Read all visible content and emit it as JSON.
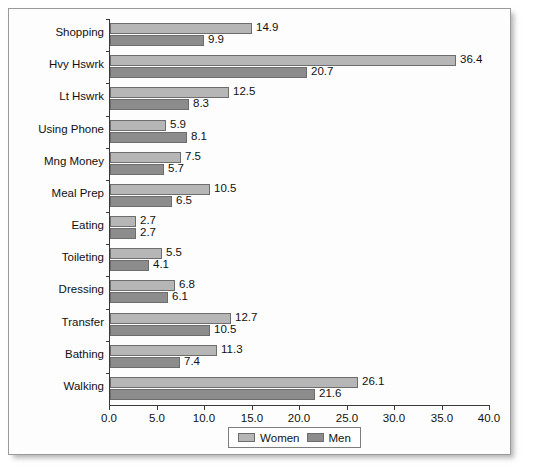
{
  "chart_data": {
    "type": "bar",
    "orientation": "horizontal",
    "title": "",
    "xlabel": "",
    "ylabel": "",
    "xlim": [
      0.0,
      40.0
    ],
    "xticks": [
      "0.0",
      "5.0",
      "10.0",
      "15.0",
      "20.0",
      "25.0",
      "30.0",
      "35.0",
      "40.0"
    ],
    "xtick_values": [
      0,
      5,
      10,
      15,
      20,
      25,
      30,
      35,
      40
    ],
    "grid": false,
    "legend_position": "bottom-center",
    "categories": [
      "Shopping",
      "Hvy Hswrk",
      "Lt Hswrk",
      "Using Phone",
      "Mng Money",
      "Meal Prep",
      "Eating",
      "Toileting",
      "Dressing",
      "Transfer",
      "Bathing",
      "Walking"
    ],
    "series": [
      {
        "name": "Women",
        "color": "#b6b6b6",
        "values": [
          14.9,
          36.4,
          12.5,
          5.9,
          7.5,
          10.5,
          2.7,
          5.5,
          6.8,
          12.7,
          11.3,
          26.1
        ],
        "labels": [
          "14.9",
          "36.4",
          "12.5",
          "5.9",
          "7.5",
          "10.5",
          "2.7",
          "5.5",
          "6.8",
          "12.7",
          "11.3",
          "26.1"
        ]
      },
      {
        "name": "Men",
        "color": "#8c8c8c",
        "values": [
          9.9,
          20.7,
          8.3,
          8.1,
          5.7,
          6.5,
          2.7,
          4.1,
          6.1,
          10.5,
          7.4,
          21.6
        ],
        "labels": [
          "9.9",
          "20.7",
          "8.3",
          "8.1",
          "5.7",
          "6.5",
          "2.7",
          "4.1",
          "6.1",
          "10.5",
          "7.4",
          "21.6"
        ]
      }
    ]
  },
  "legend": {
    "items": [
      {
        "label": "Women",
        "swatch": "women"
      },
      {
        "label": "Men",
        "swatch": "men"
      }
    ]
  }
}
